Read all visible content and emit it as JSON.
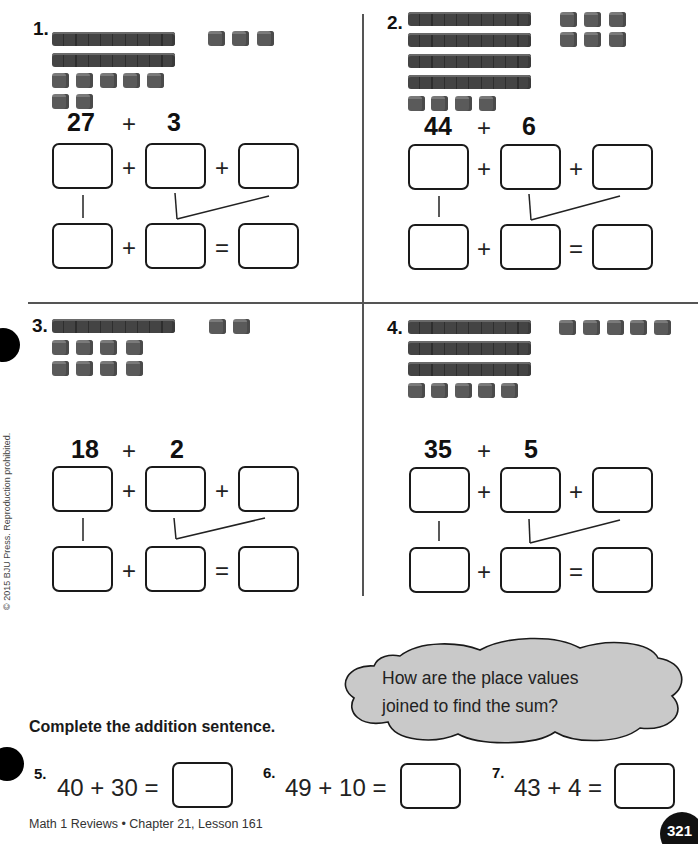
{
  "copyright": "© 2015 BJU Press. Reproduction prohibited.",
  "problems": [
    {
      "number": "1.",
      "addend1": "27",
      "plus": "+",
      "addend2": "3",
      "blocks": {
        "tens_rods": 2,
        "ones_cubes": 7,
        "extra_ones_cubes": 3
      }
    },
    {
      "number": "2.",
      "addend1": "44",
      "plus": "+",
      "addend2": "6",
      "blocks": {
        "tens_rods": 4,
        "ones_cubes": 4,
        "extra_ones_cubes": 6
      }
    },
    {
      "number": "3.",
      "addend1": "18",
      "plus": "+",
      "addend2": "2",
      "blocks": {
        "tens_rods": 1,
        "ones_cubes": 8,
        "extra_ones_cubes": 2
      }
    },
    {
      "number": "4.",
      "addend1": "35",
      "plus": "+",
      "addend2": "5",
      "blocks": {
        "tens_rods": 3,
        "ones_cubes": 5,
        "extra_ones_cubes": 5
      }
    }
  ],
  "operators": {
    "plus": "+",
    "equals": "="
  },
  "cloud": {
    "line1": "How are the place values",
    "line2": "joined to find the sum?"
  },
  "instructions": "Complete the addition sentence.",
  "sentences": [
    {
      "number": "5.",
      "expression": "40 + 30 ="
    },
    {
      "number": "6.",
      "expression": "49 + 10 ="
    },
    {
      "number": "7.",
      "expression": "43 + 4 ="
    }
  ],
  "footer": "Math 1 Reviews • Chapter 21, Lesson 161",
  "page_number": "321"
}
